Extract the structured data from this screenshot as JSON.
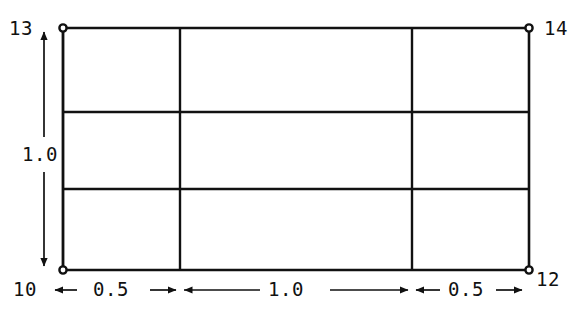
{
  "diagram": {
    "type": "finite-element-mesh-dimension-drawing",
    "background_color": "#ffffff",
    "line_color": "#111111",
    "nodes": [
      {
        "id": "node-13",
        "label": "13",
        "corner": "top-left",
        "x": 63,
        "y": 28
      },
      {
        "id": "node-14",
        "label": "14",
        "corner": "top-right",
        "x": 529,
        "y": 28
      },
      {
        "id": "node-10",
        "label": "10",
        "corner": "bottom-left",
        "x": 63,
        "y": 270
      },
      {
        "id": "node-12",
        "label": "12",
        "corner": "bottom-right",
        "x": 529,
        "y": 270
      }
    ],
    "node_labels": {
      "top_left": "13",
      "top_right": "14",
      "bottom_left": "10",
      "bottom_right": "12"
    },
    "rectangle": {
      "left": 63,
      "top": 28,
      "right": 529,
      "bottom": 270
    },
    "interior_vertical_lines_x": [
      180,
      412
    ],
    "interior_horizontal_lines_y": [
      112,
      189
    ],
    "horizontal_dimensions": [
      {
        "label": "0.5",
        "from_x": 63,
        "to_x": 180
      },
      {
        "label": "1.0",
        "from_x": 180,
        "to_x": 412
      },
      {
        "label": "0.5",
        "from_x": 412,
        "to_x": 529
      }
    ],
    "vertical_dimensions": [
      {
        "label": "1.0",
        "from_y": 28,
        "to_y": 270
      }
    ],
    "dimension_labels": {
      "bottom_left": "0.5",
      "bottom_center": "1.0",
      "bottom_right": "0.5",
      "left_vertical": "1.0"
    }
  }
}
